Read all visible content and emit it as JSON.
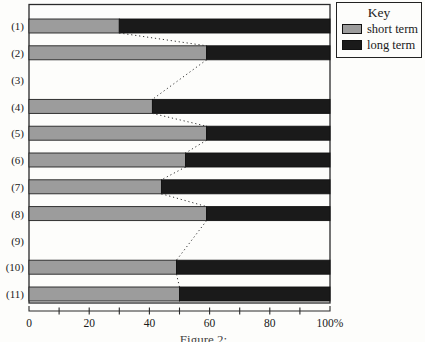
{
  "figure": {
    "background": "#fdfdfb",
    "frame_color": "#2a2a2a"
  },
  "legend": {
    "title": "Key",
    "items": [
      {
        "label": "short term",
        "color": "#9c9c9c"
      },
      {
        "label": "long term",
        "color": "#1a1a1a"
      }
    ]
  },
  "caption_fragment": "Figure 2: ...",
  "chart_data": {
    "type": "bar",
    "orientation": "horizontal-stacked",
    "title": "",
    "xlabel": "",
    "ylabel": "",
    "categories": [
      "(1)",
      "(2)",
      "(3)",
      "(4)",
      "(5)",
      "(6)",
      "(7)",
      "(8)",
      "(9)",
      "(10)",
      "(11)"
    ],
    "series": [
      {
        "name": "short term",
        "color": "#9c9c9c",
        "values": [
          30,
          59,
          null,
          41,
          59,
          52,
          44,
          59,
          null,
          49,
          50
        ]
      },
      {
        "name": "long term",
        "color": "#1a1a1a",
        "values": [
          70,
          41,
          null,
          59,
          41,
          48,
          56,
          41,
          null,
          51,
          50
        ]
      }
    ],
    "xlim": [
      0,
      100
    ],
    "x_minor_tick_step": 10,
    "x_ticks_labeled": [
      {
        "value": 0,
        "label": "0"
      },
      {
        "value": 20,
        "label": "20"
      },
      {
        "value": 40,
        "label": "40"
      },
      {
        "value": 60,
        "label": "60"
      },
      {
        "value": 80,
        "label": "80"
      },
      {
        "value": 100,
        "label": "100%"
      }
    ],
    "grid": false,
    "legend_position": "top-right",
    "annotations": "dotted connector lines join the short-term/long-term boundary of consecutive non-empty bars"
  }
}
